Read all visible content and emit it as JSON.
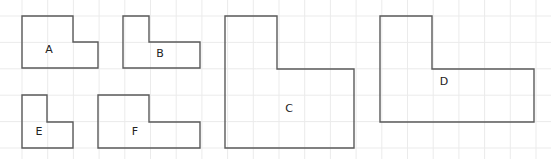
{
  "diagram": {
    "type": "grid-shapes",
    "background": "#ffffff",
    "grid": {
      "color": "#ebebeb",
      "x_lines": [
        22,
        47.7,
        73.4,
        99.1,
        124.8,
        150.5,
        176.2,
        201.9,
        227.6,
        253.3,
        279,
        304.7,
        330.4,
        356.1,
        381.8,
        407.5,
        433.2,
        458.9,
        484.6,
        510.3,
        536
      ],
      "y_lines": [
        16,
        42.4,
        68.8,
        95.2,
        121.6,
        148
      ]
    },
    "stroke_color": "#5a5a5a",
    "shapes": [
      {
        "label": "A",
        "points": "22,16 73,16 73,42 98,42 98,68 22,68",
        "label_x": 49,
        "label_y": 50
      },
      {
        "label": "B",
        "points": "123,16 149,16 149,42 200,42 200,68 123,68",
        "label_x": 160,
        "label_y": 54
      },
      {
        "label": "C",
        "points": "225,16 277,16 277,69 354,69 354,148 225,148",
        "label_x": 289,
        "label_y": 109
      },
      {
        "label": "D",
        "points": "380,16 432,16 432,69 534,69 534,122 380,122",
        "label_x": 444,
        "label_y": 82
      },
      {
        "label": "E",
        "points": "22,95 47,95 47,122 73,122 73,148 22,148",
        "label_x": 39,
        "label_y": 132
      },
      {
        "label": "F",
        "points": "98,95 149,95 149,122 200,122 200,148 98,148",
        "label_x": 135,
        "label_y": 132
      }
    ]
  }
}
